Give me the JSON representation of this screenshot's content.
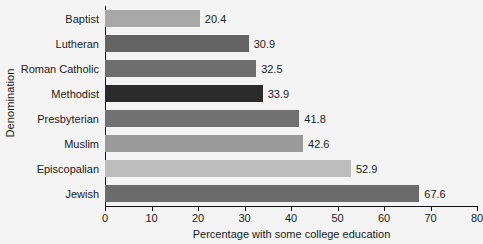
{
  "chart_data": {
    "type": "bar",
    "orientation": "horizontal",
    "title": "",
    "xlabel": "Percentage with some college education",
    "ylabel": "Denomination",
    "xlim": [
      0,
      80
    ],
    "xticks": [
      0,
      10,
      20,
      30,
      40,
      50,
      60,
      70,
      80
    ],
    "xtick_labels": [
      "0",
      "10",
      "20",
      "30",
      "40",
      "50",
      "60",
      "70",
      "80"
    ],
    "grid": false,
    "legend": "none",
    "categories": [
      "Baptist",
      "Lutheran",
      "Roman Catholic",
      "Methodist",
      "Presbyterian",
      "Muslim",
      "Episcopalian",
      "Jewish"
    ],
    "values": [
      20.4,
      30.9,
      32.5,
      33.9,
      41.8,
      42.6,
      52.9,
      67.6
    ],
    "value_labels": [
      "20.4",
      "30.9",
      "32.5",
      "33.9",
      "41.8",
      "42.6",
      "52.9",
      "67.6"
    ],
    "bar_colors": [
      "#a8a8a8",
      "#636363",
      "#6e6e6e",
      "#2b2b2b",
      "#717171",
      "#9a9a9a",
      "#bdbdbd",
      "#6b6b6b"
    ]
  },
  "figure": {
    "background_color": "#f4f4f4",
    "axis_color": "#111111",
    "text_color": "#1a1a1a"
  }
}
